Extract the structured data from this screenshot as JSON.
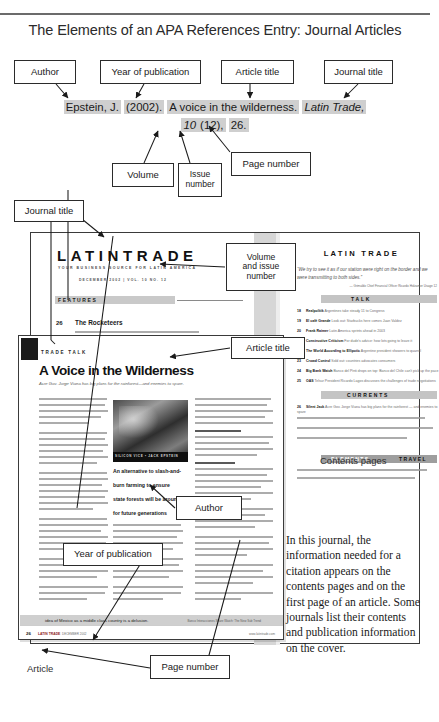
{
  "page": {
    "title": "The Elements of an APA References Entry: Journal Articles"
  },
  "citation": {
    "author": "Epstein, J.",
    "year": "(2002).",
    "article_title": "A voice in the wilderness.",
    "journal_title": "Latin Trade,",
    "volume": "10",
    "issue": "(12),",
    "page": "26."
  },
  "callouts": {
    "author": "Author",
    "year": "Year of publication",
    "article_title": "Article title",
    "journal_title": "Journal title",
    "volume": "Volume",
    "issue": "Issue\nnumber",
    "issue_line1": "Issue",
    "issue_line2": "number",
    "page_number": "Page number",
    "journal_title_2": "Journal title",
    "volume_issue_l1": "Volume",
    "volume_issue_l2": "and issue",
    "volume_issue_l3": "number",
    "article_title_2": "Article title",
    "author_2": "Author",
    "year_2": "Year of publication",
    "page_number_2": "Page number"
  },
  "labels": {
    "contents_pages": "Contents pages",
    "article": "Article"
  },
  "explanation": "In this journal, the information needed for a citation appears on the contents pages and on the first page of an article. Some journals list their contents and publication information on the cover.",
  "magazine": {
    "logo_latin": "LATIN",
    "logo_trade": "TRADE",
    "tagline": "YOUR BUSINESS SOURCE FOR LATIN AMERICA",
    "dateline": "DECEMBER 2002 | VOL. 10 NO. 12",
    "features_label": "FEATURES",
    "feature_page": "26",
    "feature_title": "The Rocketeers",
    "feature_deck": "JACK EPSTEIN | Cheap competition in Latin America's high cost serves up prize releases",
    "right_logo": "LATIN TRADE",
    "pull_quote": "“We try to see it as if our station were right on the border and we were transmitting to both sides.”",
    "pull_attribution": "— Grimaldo Chief Financial Officer Ricardo Holzamer Usage 12",
    "talk_label": "TALK",
    "currents_label": "CURRENTS",
    "travel_label_1": "ELEMENTS",
    "travel_label_2": "TRAVEL",
    "toc": [
      {
        "page": "18",
        "title": "Realpolitik",
        "desc": "Argentines take steady 11 to Congress"
      },
      {
        "page": "19",
        "title": "El café Grande",
        "desc": "Look out: Starbucks here comes Juan Valdez"
      },
      {
        "page": "20",
        "title": "Frank Raimer",
        "desc": "Latin America sprints ahead in 2003"
      },
      {
        "page": "21",
        "title": "Constructive Criticism",
        "desc": "For dude's advice: how lots going to leave it"
      },
      {
        "page": "22",
        "title": "The World According to Ellipotic",
        "desc": "Argentine president showers to quarrel"
      },
      {
        "page": "23",
        "title": "Crowd Control",
        "desc": "Sold out: countries advocates consumers"
      },
      {
        "page": "24",
        "title": "Big Bank Watch",
        "desc": "Banco del Pinti drops on top: Banco del Chile can't pick up the pace"
      },
      {
        "page": "25",
        "title": "OAS",
        "desc": "Telsur President Ricardo Lagos discusses the challenges of trade negotiations"
      },
      {
        "page": "26",
        "title": "Silent Jack",
        "desc": "Acre Gov. Jorge Viana has big plans for the rainforest — and enemies to spare"
      }
    ]
  },
  "article": {
    "kicker": "TRADE TALK",
    "headline": "A Voice in the Wilderness",
    "deck": "Acre Gov. Jorge Viana has big plans for the rainforest—and enemies to spare.",
    "photo_credit": "SILICON VICE • JACK EPSTEIN",
    "pull_quote_lines": [
      "An alternative to slash-and-",
      "burn farming to ensure",
      "state forests will be around",
      "for future generations"
    ],
    "bottom_banner": "idea of Mexico as a middle class country is a delusion.",
    "bottom_banner_right": "Banco Interacciones Share Watch: The New Sub Trend",
    "page_number": "26",
    "brand": "LATIN TRADE",
    "issue_line": "DECEMBER 2002",
    "url": "www.latintrade.com"
  },
  "colors": {
    "highlight": "#cfcfcf",
    "ink": "#1a1a1a",
    "rule": "#6b6b6b"
  }
}
